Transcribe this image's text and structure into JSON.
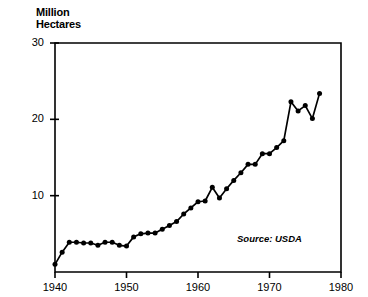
{
  "chart_data": {
    "type": "line",
    "title": "Million\nHectares",
    "xlabel": "",
    "ylabel": "Million Hectares",
    "xlim": [
      1940,
      1980
    ],
    "ylim": [
      0,
      30
    ],
    "grid": false,
    "legend": null,
    "annotation": "Source: USDA",
    "y_ticks": [
      10,
      20,
      30
    ],
    "y_tick_labels": [
      "10",
      "20",
      "30"
    ],
    "x_ticks": [
      1940,
      1950,
      1960,
      1970,
      1980
    ],
    "x_tick_labels": [
      "1940",
      "1950",
      "1960",
      "1970",
      "1980"
    ],
    "marker": "filled-circle",
    "line_color": "#000000",
    "x": [
      1940,
      1941,
      1942,
      1943,
      1944,
      1945,
      1946,
      1947,
      1948,
      1949,
      1950,
      1951,
      1952,
      1953,
      1954,
      1955,
      1956,
      1957,
      1958,
      1959,
      1960,
      1961,
      1962,
      1963,
      1964,
      1965,
      1966,
      1967,
      1968,
      1969,
      1970,
      1971,
      1972,
      1973,
      1974,
      1975,
      1976,
      1977
    ],
    "values": [
      1.0,
      2.6,
      3.9,
      3.9,
      3.8,
      3.8,
      3.5,
      3.9,
      3.9,
      3.5,
      3.4,
      4.6,
      5.0,
      5.1,
      5.1,
      5.6,
      6.1,
      6.6,
      7.6,
      8.4,
      9.2,
      9.3,
      11.1,
      9.7,
      10.9,
      12.0,
      13.0,
      14.1,
      14.1,
      15.5,
      15.5,
      16.3,
      17.2,
      22.3,
      21.1,
      21.8,
      20.1,
      23.4
    ],
    "series_name": "Area"
  },
  "geometry": {
    "plot_left": 55,
    "plot_right": 341,
    "plot_top": 43,
    "plot_bottom": 272,
    "note_x": 237,
    "note_y": 233
  },
  "colors": {
    "background": "#ffffff",
    "foreground": "#000000"
  }
}
